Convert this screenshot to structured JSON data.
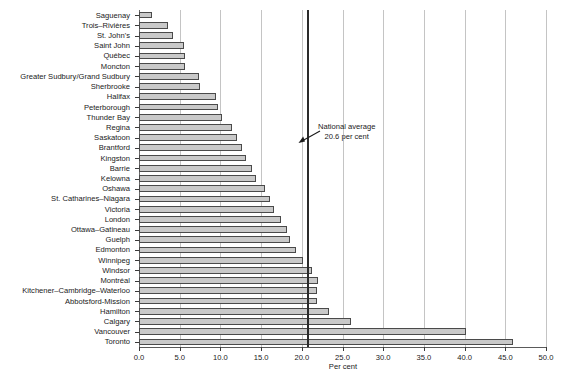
{
  "chart_data": {
    "type": "bar",
    "orientation": "horizontal",
    "title": "",
    "xlabel": "Per cent",
    "ylabel": "",
    "xlim": [
      0.0,
      50.0
    ],
    "xticks": [
      "0.0",
      "5.0",
      "10.0",
      "15.0",
      "20.0",
      "25.0",
      "30.0",
      "35.0",
      "40.0",
      "45.0",
      "50.0"
    ],
    "xtick_values": [
      0,
      5,
      10,
      15,
      20,
      25,
      30,
      35,
      40,
      45,
      50
    ],
    "grid": true,
    "legend": "none",
    "categories": [
      "Saguenay",
      "Trois–Rivières",
      "St. John's",
      "Saint John",
      "Québec",
      "Moncton",
      "Greater Sudbury/Grand Sudbury",
      "Sherbrooke",
      "Halifax",
      "Peterborough",
      "Thunder Bay",
      "Regina",
      "Saskatoon",
      "Brantford",
      "Kingston",
      "Barrie",
      "Kelowna",
      "Oshawa",
      "St. Catharines–Niagara",
      "Victoria",
      "London",
      "Ottawa–Gatineau",
      "Guelph",
      "Edmonton",
      "Winnipeg",
      "Windsor",
      "Montréal",
      "Kitchener–Cambridge–Waterloo",
      "Abbotsford-Mission",
      "Hamilton",
      "Calgary",
      "Vancouver",
      "Toronto"
    ],
    "values": [
      1.6,
      3.6,
      4.2,
      5.5,
      5.6,
      5.7,
      7.4,
      7.5,
      9.5,
      9.7,
      10.2,
      11.4,
      12.1,
      12.6,
      13.1,
      13.9,
      14.4,
      15.5,
      16.1,
      16.6,
      17.4,
      18.2,
      18.6,
      19.3,
      20.2,
      21.2,
      22.0,
      21.9,
      21.9,
      23.4,
      26.0,
      40.2,
      46.0
    ],
    "reference_line": {
      "label_line1": "National average",
      "label_line2": "20.6 per cent",
      "value": 20.6
    },
    "colors": {
      "bar_fill": "#c9c9c9",
      "bar_stroke": "#4a4a4a",
      "gridline": "#c4c4c4",
      "reference_line": "#2b2b2b",
      "axis": "#5a5a5a",
      "text": "#1a1a1a"
    }
  }
}
